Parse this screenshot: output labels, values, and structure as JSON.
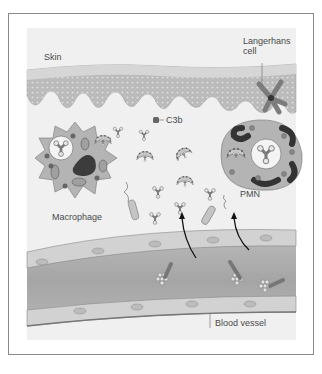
{
  "figure": {
    "labels": {
      "skin": "Skin",
      "langerhans_line1": "Langerhans",
      "langerhans_line2": "cell",
      "c3b": "C3b",
      "macrophage": "Macrophage",
      "pmn": "PMN",
      "blood_vessel": "Blood vessel"
    },
    "colors": {
      "background": "#f0f0f0",
      "skin_top": "#d6d6d6",
      "skin_body": "#bdbdbd",
      "vessel_wall": "#c8c8c8",
      "vessel_lumen": "#a9a9a9",
      "cell_cytoplasm": "#b4b4b4",
      "nucleus": "#3c3c3c",
      "text": "#4a4a4a",
      "frame": "#8a8a8a"
    }
  }
}
